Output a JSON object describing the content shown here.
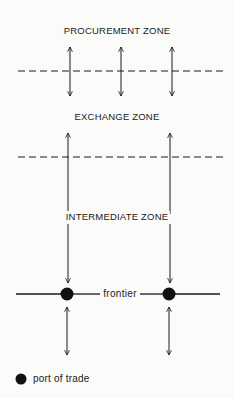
{
  "diagram": {
    "zones": [
      {
        "label": "PROCUREMENT ZONE"
      },
      {
        "label": "EXCHANGE ZONE"
      },
      {
        "label": "INTERMEDIATE ZONE"
      }
    ],
    "boundaries": [
      {
        "type": "dashed",
        "between": [
          "PROCUREMENT ZONE",
          "EXCHANGE ZONE"
        ]
      },
      {
        "type": "dashed",
        "between": [
          "EXCHANGE ZONE",
          "INTERMEDIATE ZONE"
        ]
      },
      {
        "type": "solid",
        "label": "frontier"
      }
    ],
    "arrows": {
      "procurement_exchange_count": 3,
      "exchange_to_ports_count": 2,
      "below_frontier_count": 2
    },
    "ports_count": 2,
    "frontier_label": "frontier",
    "legend": {
      "symbol": "filled-circle",
      "label": "port of trade"
    },
    "colors": {
      "ink": "#1a1a1a",
      "background": "#fbfbf9"
    }
  }
}
